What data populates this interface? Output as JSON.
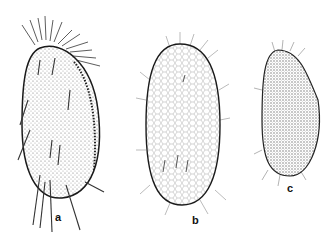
{
  "figure": {
    "type": "scientific-illustration",
    "panels": [
      {
        "id": "a",
        "label": "a",
        "description": "Elongated ovoid ciliate with long stout cirri at anterior and posterior ends, stippled surface, dorsal row of cilia on right margin"
      },
      {
        "id": "b",
        "label": "b",
        "description": "Larger ovoid ciliate with polygonal surface reticulation and fine short cilia around margin"
      },
      {
        "id": "c",
        "label": "c",
        "description": "Smaller ovoid ciliate with dense stippled surface and short marginal cilia"
      }
    ],
    "colors": {
      "ink": "#1a1a1a",
      "background": "#ffffff",
      "stipple": "#8a8a8a"
    }
  }
}
